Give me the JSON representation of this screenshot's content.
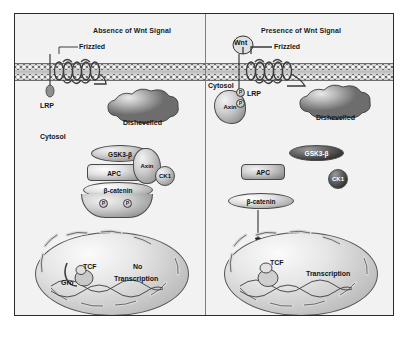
{
  "figure": {
    "background": "#f2f2f2",
    "border_color": "#2b2b2b",
    "divider_color": "#7d7d7d"
  },
  "panels": [
    {
      "id": "left",
      "title": "Absence of Wnt Signal",
      "compartment_label": "Cytosol",
      "membrane_label": "",
      "receptors": [
        {
          "name": "Frizzled",
          "label": "Frizzled"
        },
        {
          "name": "LRP",
          "label": "LRP"
        }
      ],
      "proteins": [
        {
          "name": "dishevelled",
          "label": "Dishevelled"
        },
        {
          "name": "gsk3b",
          "label": "GSK3-β"
        },
        {
          "name": "apc",
          "label": "APC"
        },
        {
          "name": "axin",
          "label": "Axin"
        },
        {
          "name": "ck1",
          "label": "CK1"
        },
        {
          "name": "beta-catenin",
          "label": "β-catenin"
        }
      ],
      "phosphates": [
        "P",
        "P"
      ],
      "nucleus": {
        "tcf_label": "TCF",
        "groucho_label": "Gro",
        "outcome_line1": "No",
        "outcome_line2": "Transcription"
      }
    },
    {
      "id": "right",
      "title": "Presence of Wnt Signal",
      "compartment_label": "Cytosol",
      "ligand_label": "Wnt",
      "receptors": [
        {
          "name": "Frizzled",
          "label": "Frizzled"
        },
        {
          "name": "LRP",
          "label": "LRP"
        }
      ],
      "proteins": [
        {
          "name": "axin",
          "label": "Axin"
        },
        {
          "name": "dishevelled",
          "label": "Dishevelled"
        },
        {
          "name": "gsk3b",
          "label": "GSK3-β"
        },
        {
          "name": "apc",
          "label": "APC"
        },
        {
          "name": "ck1",
          "label": "CK1"
        },
        {
          "name": "beta-catenin",
          "label": "β-catenin"
        }
      ],
      "phosphates": [
        "P",
        "P"
      ],
      "nucleus": {
        "tcf_label": "TCF",
        "outcome_line1": "Transcription"
      }
    }
  ]
}
